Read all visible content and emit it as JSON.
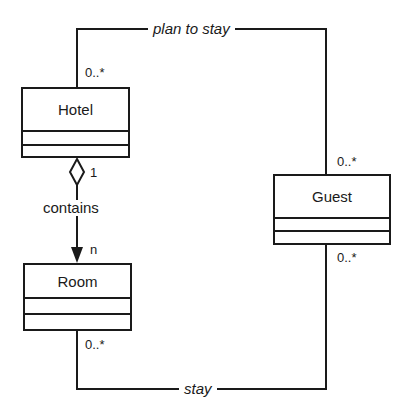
{
  "diagram": {
    "type": "UML class diagram",
    "classes": [
      {
        "id": "hotel",
        "name": "Hotel"
      },
      {
        "id": "room",
        "name": "Room"
      },
      {
        "id": "guest",
        "name": "Guest"
      }
    ],
    "associations": [
      {
        "id": "plan-to-stay",
        "label": "plan to stay",
        "from": "Hotel",
        "to": "Guest",
        "from_multiplicity": "0..*",
        "to_multiplicity": "0..*"
      },
      {
        "id": "contains",
        "label": "contains",
        "kind": "aggregation",
        "from": "Hotel",
        "to": "Room",
        "from_multiplicity": "1",
        "to_multiplicity": "n"
      },
      {
        "id": "stay",
        "label": "stay",
        "from": "Room",
        "to": "Guest",
        "from_multiplicity": "0..*",
        "to_multiplicity": "0..*"
      }
    ]
  },
  "labels": {
    "hotel": "Hotel",
    "room": "Room",
    "guest": "Guest",
    "plan_to_stay": "plan to stay",
    "contains": "contains",
    "stay": "stay",
    "mult_hotel_plan": "0..*",
    "mult_guest_plan": "0..*",
    "mult_hotel_contains": "1",
    "mult_room_contains": "n",
    "mult_room_stay": "0..*",
    "mult_guest_stay": "0..*"
  },
  "colors": {
    "line": "#1a1a1a",
    "background": "#ffffff"
  }
}
